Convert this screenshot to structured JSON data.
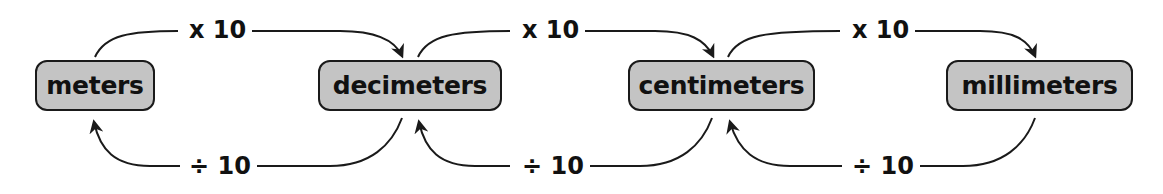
{
  "diagram": {
    "title": "",
    "units": [
      {
        "id": "meters",
        "label": "meters"
      },
      {
        "id": "decimeters",
        "label": "decimeters"
      },
      {
        "id": "centimeters",
        "label": "centimeters"
      },
      {
        "id": "millimeters",
        "label": "millimeters"
      }
    ],
    "forward_edges": [
      {
        "from": "meters",
        "to": "decimeters",
        "label": "x 10"
      },
      {
        "from": "decimeters",
        "to": "centimeters",
        "label": "x 10"
      },
      {
        "from": "centimeters",
        "to": "millimeters",
        "label": "x 10"
      }
    ],
    "backward_edges": [
      {
        "from": "decimeters",
        "to": "meters",
        "label": "÷ 10"
      },
      {
        "from": "centimeters",
        "to": "decimeters",
        "label": "÷ 10"
      },
      {
        "from": "millimeters",
        "to": "centimeters",
        "label": "÷ 10"
      }
    ],
    "colors": {
      "box_fill": "#c4c4c4",
      "box_border": "#1a1a1a",
      "text": "#111111",
      "arrow": "#1a1a1a"
    }
  }
}
